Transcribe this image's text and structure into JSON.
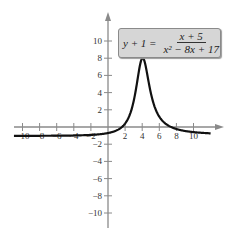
{
  "chart_data": {
    "type": "line",
    "title": "",
    "equation": {
      "lhs": "y + 1 =",
      "numerator": "x + 5",
      "denominator": "x² − 8x + 17"
    },
    "xlabel": "",
    "ylabel": "",
    "xlim": [
      -11,
      12
    ],
    "ylim": [
      -12,
      12
    ],
    "x_ticks": [
      -10,
      -8,
      -6,
      -4,
      -2,
      2,
      4,
      6,
      8,
      10
    ],
    "y_ticks": [
      -10,
      -8,
      -6,
      -4,
      -2,
      2,
      4,
      6,
      8,
      10
    ],
    "x_tick_labels": [
      "−10",
      "−8",
      "−6",
      "−4",
      "−2",
      "2",
      "4",
      "6",
      "8",
      "10"
    ],
    "y_tick_labels": [
      "−10",
      "−8",
      "−6",
      "−4",
      "−2",
      "2",
      "4",
      "6",
      "8",
      "10"
    ],
    "grid": false,
    "series": [
      {
        "name": "y = (x+5)/(x^2-8x+17) - 1",
        "x": [
          -11,
          -10,
          -8,
          -6,
          -4,
          -2,
          0,
          1,
          2,
          3,
          3.5,
          4,
          4.5,
          5,
          6,
          7,
          8,
          10,
          12
        ],
        "values": [
          -0.96,
          -0.96,
          -0.97,
          -0.99,
          -0.98,
          -0.9,
          -0.71,
          -0.4,
          0.4,
          3.0,
          5.9,
          8.0,
          6.6,
          4.0,
          1.2,
          0.2,
          -0.24,
          -0.59,
          -0.72
        ]
      }
    ],
    "peak": {
      "x": 4,
      "y": 8
    }
  },
  "colors": {
    "axis": "#8a8a8a",
    "curve": "#111111",
    "equation_box": "#d6d6d6"
  }
}
